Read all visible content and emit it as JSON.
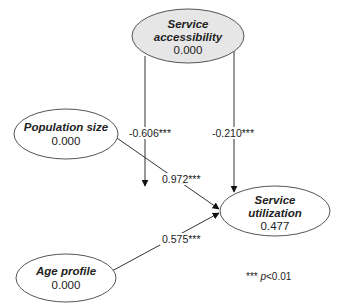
{
  "diagram": {
    "type": "path-model",
    "nodes": [
      {
        "id": "service_accessibility",
        "title_lines": [
          "Service",
          "accessibility"
        ],
        "value": "0.000",
        "fill": "#e6e6e6"
      },
      {
        "id": "population_size",
        "title_lines": [
          "Population size"
        ],
        "value": "0.000",
        "fill": "#ffffff"
      },
      {
        "id": "age_profile",
        "title_lines": [
          "Age profile"
        ],
        "value": "0.000",
        "fill": "#ffffff"
      },
      {
        "id": "service_utilization",
        "title_lines": [
          "Service",
          "utilization"
        ],
        "value": "0.477",
        "fill": "#ffffff"
      }
    ],
    "edges": [
      {
        "from": "service_accessibility",
        "to": "population_size_to_utilization_path",
        "label": "-0.606***"
      },
      {
        "from": "service_accessibility",
        "to": "service_utilization",
        "label": "-0.210***"
      },
      {
        "from": "population_size",
        "to": "service_utilization",
        "label": "0.972***"
      },
      {
        "from": "age_profile",
        "to": "service_utilization",
        "label": "0.575***"
      }
    ],
    "note": {
      "stars": "***",
      "p_symbol": "p",
      "threshold": "<0.01"
    }
  }
}
